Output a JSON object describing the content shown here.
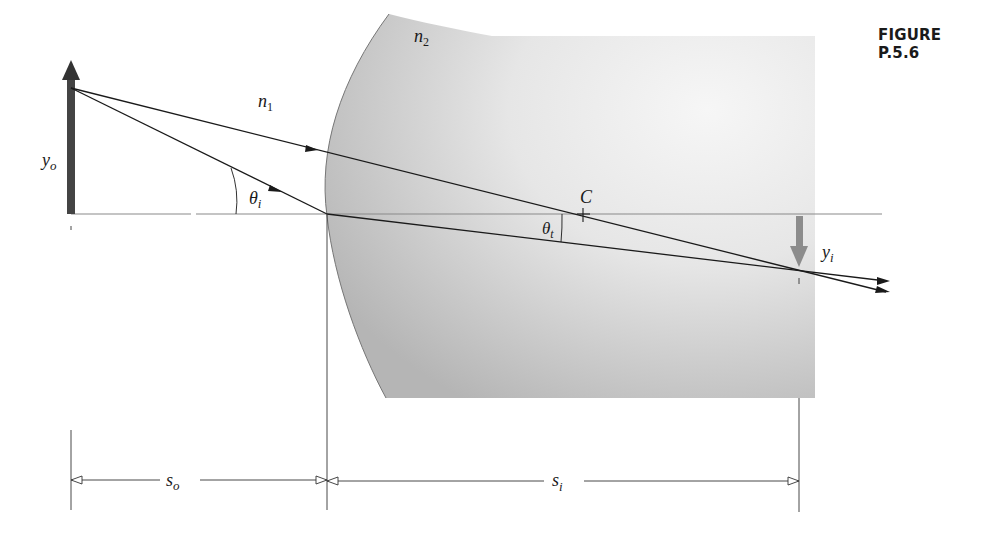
{
  "figure": {
    "title": "FIGURE P.5.6"
  },
  "labels": {
    "n1": {
      "base": "n",
      "sub": "1"
    },
    "n2": {
      "base": "n",
      "sub": "2"
    },
    "yo": {
      "base": "y",
      "sub": "o"
    },
    "yi": {
      "base": "y",
      "sub": "i"
    },
    "theta_i": {
      "base": "θ",
      "sub": "i"
    },
    "theta_t": {
      "base": "θ",
      "sub": "t"
    },
    "center": "C",
    "so": {
      "base": "s",
      "sub": "o"
    },
    "si": {
      "base": "s",
      "sub": "i"
    }
  },
  "colors": {
    "ink": "#1a1a1a",
    "axis": "#8a8a8a",
    "object_arrow": "#444444",
    "image_arrow": "#8c8c8c",
    "glass_dark": "#b4b4b4",
    "glass_light": "#f4f4f4"
  }
}
